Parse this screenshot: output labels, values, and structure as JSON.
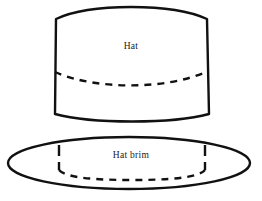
{
  "diagram": {
    "background_color": "#ffffff",
    "stroke_color": "#111111",
    "labels": {
      "hat": "Hat",
      "hat_brim": "Hat brim"
    },
    "shapes": {
      "hat_body": {
        "name": "hat-crown-band",
        "description": "Cylindrical hat crown drawn as a barrel shape with curved top and bottom edges",
        "left_x": 54,
        "right_x": 209,
        "top_y": 6,
        "bottom_y": 117,
        "stroke_width": 2.4,
        "style": "solid"
      },
      "hat_body_dashed_arc": {
        "name": "hat-crown-hidden-seam",
        "description": "Dashed arc across the hat crown indicating the hidden rear seam line",
        "start_x": 54,
        "end_x": 209,
        "apex_y": 82,
        "edge_y": 72,
        "stroke_width": 2.4,
        "style": "dashed",
        "dash_pattern": "7 6"
      },
      "hat_brim_ellipse": {
        "name": "hat-brim-outline",
        "description": "Large flat ellipse forming the hat brim outline",
        "center_x": 129,
        "center_y": 163,
        "radius_x": 121,
        "radius_y": 26,
        "stroke_width": 2.4,
        "style": "solid"
      },
      "hat_brim_inner_opening": {
        "name": "hat-brim-inner-opening",
        "description": "Dashed inner opening of the brim: two short vertical sides plus a curved dashed bottom arc",
        "left_x": 59,
        "right_x": 205,
        "top_y": 145,
        "bottom_apex_y": 176,
        "stroke_width": 2.4,
        "style": "dashed",
        "dash_pattern": "7 6"
      }
    }
  }
}
